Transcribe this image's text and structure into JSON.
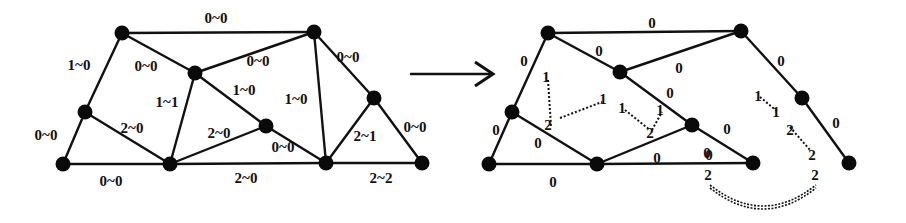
{
  "figure": {
    "left_graph": {
      "nodes": [
        {
          "id": "A",
          "x": 122,
          "y": 33
        },
        {
          "id": "B",
          "x": 314,
          "y": 32
        },
        {
          "id": "C",
          "x": 195,
          "y": 73
        },
        {
          "id": "D",
          "x": 85,
          "y": 112
        },
        {
          "id": "E",
          "x": 374,
          "y": 98
        },
        {
          "id": "F",
          "x": 266,
          "y": 126
        },
        {
          "id": "G",
          "x": 63,
          "y": 164
        },
        {
          "id": "H",
          "x": 170,
          "y": 164
        },
        {
          "id": "I",
          "x": 326,
          "y": 163
        },
        {
          "id": "J",
          "x": 422,
          "y": 163
        }
      ],
      "edges": [
        {
          "from": "A",
          "to": "B",
          "label": "0~0",
          "lx": 216,
          "ly": 23
        },
        {
          "from": "A",
          "to": "C",
          "label": "0~0",
          "lx": 146,
          "ly": 71
        },
        {
          "from": "A",
          "to": "D",
          "label": "1~0",
          "lx": 79,
          "ly": 70
        },
        {
          "from": "C",
          "to": "B",
          "label": "0~0",
          "lx": 258,
          "ly": 66
        },
        {
          "from": "B",
          "to": "E",
          "label": "0~0",
          "lx": 348,
          "ly": 62
        },
        {
          "from": "B",
          "to": "I",
          "label": "1~0",
          "lx": 296,
          "ly": 104
        },
        {
          "from": "C",
          "to": "H",
          "label": "1~1",
          "lx": 167,
          "ly": 107
        },
        {
          "from": "C",
          "to": "F",
          "label": "1~0",
          "lx": 244,
          "ly": 95
        },
        {
          "from": "D",
          "to": "G",
          "label": "0~0",
          "lx": 46,
          "ly": 140
        },
        {
          "from": "D",
          "to": "H",
          "label": "2~0",
          "lx": 132,
          "ly": 133
        },
        {
          "from": "H",
          "to": "F",
          "label": "2~0",
          "lx": 219,
          "ly": 138
        },
        {
          "from": "F",
          "to": "I",
          "label": "0~0",
          "lx": 283,
          "ly": 152
        },
        {
          "from": "E",
          "to": "I",
          "label": "2~1",
          "lx": 365,
          "ly": 141
        },
        {
          "from": "E",
          "to": "J",
          "label": "0~0",
          "lx": 415,
          "ly": 132
        },
        {
          "from": "G",
          "to": "H",
          "label": "0~0",
          "lx": 111,
          "ly": 186
        },
        {
          "from": "H",
          "to": "I",
          "label": "2~0",
          "lx": 246,
          "ly": 183
        },
        {
          "from": "I",
          "to": "J",
          "label": "2~2",
          "lx": 381,
          "ly": 183
        }
      ]
    },
    "arrow": {
      "x1": 411,
      "y1": 74,
      "x2": 493,
      "y2": 74,
      "symbol": "right-arrow"
    },
    "right_graph": {
      "nodes": [
        {
          "id": "A",
          "x": 548,
          "y": 33
        },
        {
          "id": "B",
          "x": 741,
          "y": 31
        },
        {
          "id": "C",
          "x": 620,
          "y": 72
        },
        {
          "id": "D",
          "x": 512,
          "y": 112
        },
        {
          "id": "E",
          "x": 802,
          "y": 98
        },
        {
          "id": "F",
          "x": 692,
          "y": 125
        },
        {
          "id": "G",
          "x": 489,
          "y": 164
        },
        {
          "id": "H",
          "x": 597,
          "y": 164
        },
        {
          "id": "I",
          "x": 753,
          "y": 163
        },
        {
          "id": "J",
          "x": 849,
          "y": 163
        }
      ],
      "edges": [
        {
          "from": "A",
          "to": "B",
          "label": "0",
          "lx": 652,
          "ly": 28
        },
        {
          "from": "A",
          "to": "C",
          "label": "0",
          "lx": 599,
          "ly": 56
        },
        {
          "from": "A",
          "to": "D",
          "label": "0",
          "lx": 524,
          "ly": 66
        },
        {
          "from": "C",
          "to": "B",
          "label": "0",
          "lx": 679,
          "ly": 73
        },
        {
          "from": "B",
          "to": "E",
          "label": "0",
          "lx": 781,
          "ly": 66
        },
        {
          "from": "C",
          "to": "F",
          "label": "0",
          "lx": 670,
          "ly": 98
        },
        {
          "from": "D",
          "to": "G",
          "label": "0",
          "lx": 496,
          "ly": 135
        },
        {
          "from": "D",
          "to": "H",
          "label": "0",
          "lx": 538,
          "ly": 148
        },
        {
          "from": "H",
          "to": "F",
          "label": "0",
          "lx": 657,
          "ly": 163
        },
        {
          "from": "F",
          "to": "I",
          "label": "0",
          "lx": 727,
          "ly": 134
        },
        {
          "from": "E",
          "to": "J",
          "label": "0",
          "lx": 836,
          "ly": 128
        },
        {
          "from": "G",
          "to": "H",
          "label": "0",
          "lx": 553,
          "ly": 187
        },
        {
          "from": "H",
          "to": "I",
          "label": "0",
          "lx": 709,
          "ly": 160
        }
      ],
      "dashed_pairs": [
        {
          "a": "1",
          "b": "2",
          "ax": 548,
          "ay": 80,
          "bx": 551,
          "by": 126
        },
        {
          "a": "2",
          "b": "1",
          "ax": 560,
          "ay": 118,
          "bx": 602,
          "by": 102
        },
        {
          "a": "1",
          "b": "2",
          "ax": 625,
          "ay": 110,
          "bx": 650,
          "by": 130
        },
        {
          "a": "2",
          "b": "1",
          "ax": 652,
          "ay": 130,
          "bx": 662,
          "by": 112
        },
        {
          "a": "1",
          "b": "1",
          "ax": 760,
          "ay": 97,
          "bx": 778,
          "by": 112
        },
        {
          "a": "2",
          "b": "2",
          "ax": 790,
          "ay": 127,
          "bx": 810,
          "by": 150
        }
      ],
      "double_dashed_arc": {
        "from_label": "2",
        "to_label": "2",
        "x1": 710,
        "y1": 185,
        "x2": 816,
        "y2": 185,
        "cy": 215
      }
    }
  },
  "labels": {
    "right_node_labels": [
      {
        "text": "1",
        "x": 546,
        "y": 82
      },
      {
        "text": "2",
        "x": 548,
        "y": 130
      },
      {
        "text": "1",
        "x": 603,
        "y": 104
      },
      {
        "text": "1",
        "x": 622,
        "y": 113
      },
      {
        "text": "1",
        "x": 660,
        "y": 115
      },
      {
        "text": "2",
        "x": 650,
        "y": 138
      },
      {
        "text": "1",
        "x": 758,
        "y": 101
      },
      {
        "text": "1",
        "x": 776,
        "y": 117
      },
      {
        "text": "2",
        "x": 790,
        "y": 135
      },
      {
        "text": "2",
        "x": 812,
        "y": 160
      },
      {
        "text": "0",
        "x": 707,
        "y": 158
      },
      {
        "text": "2",
        "x": 708,
        "y": 180
      },
      {
        "text": "2",
        "x": 815,
        "y": 180
      }
    ]
  }
}
